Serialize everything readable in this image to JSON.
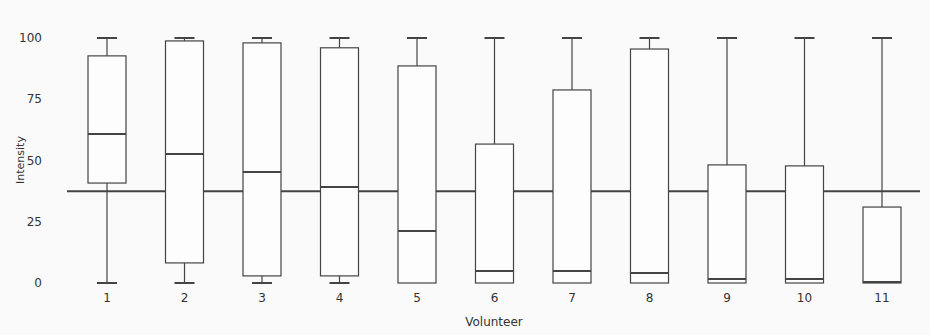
{
  "chart_data": {
    "type": "box",
    "title": "",
    "xlabel": "Volunteer",
    "ylabel": "Intensity",
    "ylim": [
      0,
      100
    ],
    "yticks": [
      0,
      25,
      50,
      75,
      100
    ],
    "categories": [
      "1",
      "2",
      "3",
      "4",
      "5",
      "6",
      "7",
      "8",
      "9",
      "10",
      "11"
    ],
    "boxes": [
      {
        "label": "1",
        "min": 0,
        "q1": 40.8,
        "median": 60.8,
        "q3": 92.7,
        "max": 100
      },
      {
        "label": "2",
        "min": 0,
        "q1": 8.2,
        "median": 52.7,
        "q3": 98.8,
        "max": 100
      },
      {
        "label": "3",
        "min": 0,
        "q1": 2.9,
        "median": 45.3,
        "q3": 98.0,
        "max": 100
      },
      {
        "label": "4",
        "min": 0,
        "q1": 2.9,
        "median": 39.2,
        "q3": 96.0,
        "max": 100
      },
      {
        "label": "5",
        "min": 0,
        "q1": 0,
        "median": 21.2,
        "q3": 88.6,
        "max": 100
      },
      {
        "label": "6",
        "min": 0,
        "q1": 0,
        "median": 4.9,
        "q3": 56.7,
        "max": 100
      },
      {
        "label": "7",
        "min": 0,
        "q1": 0,
        "median": 4.9,
        "q3": 78.8,
        "max": 100
      },
      {
        "label": "8",
        "min": 0,
        "q1": 0,
        "median": 4.1,
        "q3": 95.5,
        "max": 100
      },
      {
        "label": "9",
        "min": 0,
        "q1": 0,
        "median": 1.6,
        "q3": 48.2,
        "max": 100
      },
      {
        "label": "10",
        "min": 0,
        "q1": 0,
        "median": 1.6,
        "q3": 47.8,
        "max": 100
      },
      {
        "label": "11",
        "min": 0,
        "q1": 0,
        "median": 0.4,
        "q3": 31.0,
        "max": 100
      }
    ],
    "reference_line": {
      "y": 37.5,
      "orientation": "horizontal"
    },
    "grid": false,
    "legend": null
  }
}
